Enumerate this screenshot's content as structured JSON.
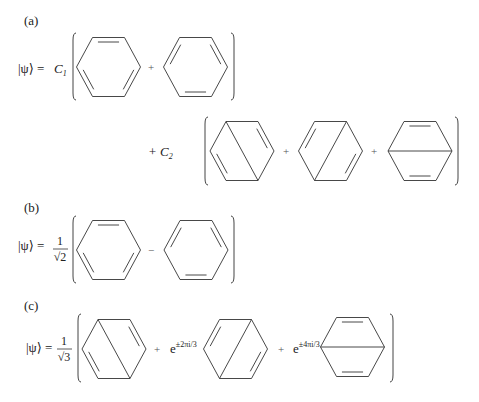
{
  "figure": {
    "width": 479,
    "height": 402,
    "colors": {
      "ink": "#333333",
      "background": "#ffffff"
    }
  },
  "panels": [
    {
      "id": "a",
      "label": "(a)",
      "label_pos": [
        24,
        25
      ],
      "lhs": {
        "text": "|ψ⟩ =",
        "pos": [
          18,
          73
        ]
      },
      "rows": [
        {
          "prefix": {
            "text": "C",
            "sub": "1",
            "pos": [
              54,
              73
            ]
          },
          "bracket": {
            "left_x": 73,
            "right_x": 234,
            "top": 33,
            "bottom": 100
          },
          "terms": [
            {
              "operator": "",
              "structure": "kekule-1",
              "center": [
                108.5,
                67
              ]
            },
            {
              "operator": "+",
              "operator_pos": [
                151,
                71
              ],
              "structure": "kekule-2",
              "center": [
                195.5,
                67
              ]
            }
          ]
        },
        {
          "prefix": {
            "text": "+ C",
            "sub": "2",
            "pos": [
              148,
              156
            ]
          },
          "bracket": {
            "left_x": 205,
            "right_x": 458,
            "top": 117,
            "bottom": 185
          },
          "terms": [
            {
              "operator": "",
              "structure": "dewar-1",
              "center": [
                242,
                151
              ]
            },
            {
              "operator": "+",
              "operator_pos": [
                286,
                155
              ],
              "structure": "dewar-2",
              "center": [
                330.5,
                151
              ]
            },
            {
              "operator": "+",
              "operator_pos": [
                374,
                155
              ],
              "structure": "dewar-3",
              "center": [
                420,
                151
              ]
            }
          ]
        }
      ]
    },
    {
      "id": "b",
      "label": "(b)",
      "label_pos": [
        24,
        212
      ],
      "lhs": {
        "text": "|ψ⟩ =",
        "pos": [
          18,
          250
        ]
      },
      "rows": [
        {
          "prefix": {
            "fraction": {
              "num": "1",
              "den": "√2"
            },
            "pos": [
              60,
              250
            ]
          },
          "bracket": {
            "left_x": 73,
            "right_x": 234,
            "top": 216,
            "bottom": 283
          },
          "terms": [
            {
              "operator": "",
              "structure": "kekule-1",
              "center": [
                108.5,
                250
              ]
            },
            {
              "operator": "−",
              "operator_pos": [
                151,
                254
              ],
              "structure": "kekule-2",
              "center": [
                196,
                250
              ]
            }
          ]
        }
      ]
    },
    {
      "id": "c",
      "label": "(c)",
      "label_pos": [
        24,
        310
      ],
      "lhs": {
        "text": "|ψ⟩ =",
        "pos": [
          26,
          352
        ]
      },
      "rows": [
        {
          "prefix": {
            "fraction": {
              "num": "1",
              "den": "√3"
            },
            "pos": [
              64,
              350
            ]
          },
          "bracket": {
            "left_x": 78,
            "right_x": 393,
            "top": 314,
            "bottom": 382
          },
          "terms": [
            {
              "operator": "",
              "structure": "dewar-1",
              "center": [
                114,
                349
              ]
            },
            {
              "operator": "+",
              "operator_pos": [
                157,
                353
              ],
              "coefficient": {
                "base": "e",
                "exp": "±2πi/3"
              },
              "coef_pos": [
                170,
                353
              ],
              "structure": "dewar-2",
              "center": [
                235.5,
                349
              ]
            },
            {
              "operator": "+",
              "operator_pos": [
                281,
                353
              ],
              "coefficient": {
                "base": "e",
                "exp": "±4πi/3"
              },
              "coef_pos": [
                293,
                353
              ],
              "structure": "dewar-3",
              "center": [
                352.5,
                347
              ]
            }
          ]
        }
      ]
    }
  ],
  "structures": {
    "kekule-1": {
      "name": "Kekulé structure (double bonds: top, lower-left, lower-right)",
      "double_edges": [
        0,
        2,
        4
      ],
      "cross_bond": null
    },
    "kekule-2": {
      "name": "Kekulé structure (double bonds: upper-right, bottom, upper-left)",
      "double_edges": [
        1,
        3,
        5
      ],
      "cross_bond": null
    },
    "dewar-1": {
      "name": "Dewar structure (para bond upper-left to lower-right)",
      "double_edges": [
        1,
        4
      ],
      "cross_bond": [
        0,
        3
      ]
    },
    "dewar-2": {
      "name": "Dewar structure (para bond upper-right to lower-left)",
      "double_edges": [
        2,
        5
      ],
      "cross_bond": [
        1,
        4
      ]
    },
    "dewar-3": {
      "name": "Dewar structure (para bond left to right)",
      "double_edges": [
        0,
        3
      ],
      "cross_bond": [
        5,
        2
      ]
    }
  },
  "ring_geometry": {
    "half_width": 32,
    "half_top": 16,
    "half_height": 29.5,
    "inner_offset": 4.5,
    "inner_shrink": 0.17
  }
}
